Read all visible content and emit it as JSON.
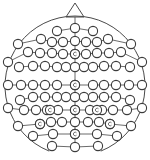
{
  "diagram": {
    "title": "EEG electrode montage (10-10 system)",
    "colors": {
      "stroke": "#3c3c3c",
      "background": "#ffffff"
    },
    "head": {
      "cx": 75,
      "cy": 86,
      "r": 70
    },
    "nose": {
      "apex": [
        75,
        3
      ],
      "left": [
        66,
        17
      ],
      "right": [
        84,
        17
      ]
    },
    "electrode_radius": 4.6,
    "rows": [
      {
        "name": "Fp",
        "points": [
          [
            57,
            31
          ],
          [
            75,
            28
          ],
          [
            93,
            31
          ]
        ]
      },
      {
        "name": "AF",
        "points": [
          [
            18,
            44
          ],
          [
            41,
            39
          ],
          [
            52,
            42
          ],
          [
            63,
            42
          ],
          [
            75,
            41
          ],
          [
            86,
            42
          ],
          [
            97,
            42
          ],
          [
            108,
            39
          ],
          [
            131,
            44
          ]
        ]
      },
      {
        "name": "F",
        "points": [
          [
            8,
            62
          ],
          [
            28,
            52
          ],
          [
            40,
            53
          ],
          [
            52,
            53
          ],
          [
            63,
            54
          ],
          [
            75,
            54
          ],
          [
            86,
            54
          ],
          [
            97,
            53
          ],
          [
            109,
            53
          ],
          [
            121,
            52
          ],
          [
            142,
            62
          ]
        ]
      },
      {
        "name": "FC",
        "points": [
          [
            19,
            67
          ],
          [
            33,
            66
          ],
          [
            45,
            66
          ],
          [
            57,
            67
          ],
          [
            66,
            67
          ],
          [
            75,
            67
          ],
          [
            84,
            67
          ],
          [
            93,
            67
          ],
          [
            104,
            66
          ],
          [
            116,
            66
          ],
          [
            130,
            67
          ]
        ]
      },
      {
        "name": "C",
        "points": [
          [
            8,
            85
          ],
          [
            21,
            85
          ],
          [
            33,
            85
          ],
          [
            45,
            85
          ],
          [
            57,
            85
          ],
          [
            75,
            85
          ],
          [
            93,
            85
          ],
          [
            104,
            85
          ],
          [
            116,
            85
          ],
          [
            129,
            85
          ],
          [
            142,
            85
          ]
        ]
      },
      {
        "name": "CP",
        "points": [
          [
            20,
            100
          ],
          [
            33,
            97
          ],
          [
            45,
            97
          ],
          [
            57,
            97
          ],
          [
            66,
            97
          ],
          [
            75,
            97
          ],
          [
            84,
            97
          ],
          [
            93,
            97
          ],
          [
            104,
            97
          ],
          [
            116,
            97
          ],
          [
            130,
            100
          ]
        ]
      },
      {
        "name": "P",
        "points": [
          [
            8,
            108
          ],
          [
            24,
            110
          ],
          [
            36,
            110
          ],
          [
            47,
            110
          ],
          [
            58,
            110
          ],
          [
            75,
            110
          ],
          [
            90,
            110
          ],
          [
            102,
            110
          ],
          [
            113,
            110
          ],
          [
            127,
            110
          ],
          [
            142,
            108
          ]
        ]
      },
      {
        "name": "PO",
        "points": [
          [
            18,
            126
          ],
          [
            40,
            124
          ],
          [
            51,
            122
          ],
          [
            62,
            122
          ],
          [
            75,
            122
          ],
          [
            88,
            122
          ],
          [
            99,
            122
          ],
          [
            110,
            124
          ],
          [
            131,
            126
          ]
        ]
      },
      {
        "name": "O",
        "points": [
          [
            33,
            136
          ],
          [
            53,
            134
          ],
          [
            75,
            134
          ],
          [
            97,
            134
          ],
          [
            117,
            136
          ]
        ]
      },
      {
        "name": "I",
        "points": [
          [
            52,
            146
          ],
          [
            75,
            147
          ],
          [
            98,
            146
          ]
        ]
      }
    ],
    "marked_electrodes": [
      {
        "label": "Fz",
        "point": [
          75,
          54
        ]
      },
      {
        "label": "Cz",
        "point": [
          75,
          85
        ]
      },
      {
        "label": "P3",
        "point": [
          50,
          110
        ]
      },
      {
        "label": "Pz",
        "point": [
          75,
          110
        ]
      },
      {
        "label": "P4",
        "point": [
          97,
          110
        ]
      },
      {
        "label": "PO7",
        "point": [
          40,
          124
        ]
      },
      {
        "label": "PO8",
        "point": [
          110,
          124
        ]
      },
      {
        "label": "Oz",
        "point": [
          75,
          134
        ]
      }
    ]
  }
}
